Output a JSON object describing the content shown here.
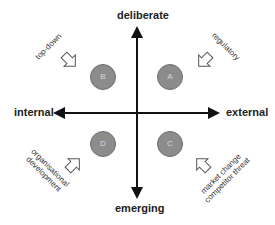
{
  "axes": {
    "top": "deliberate",
    "bottom": "emerging",
    "left": "internal",
    "right": "external"
  },
  "quadrants": [
    {
      "id": "B",
      "position": "top-left",
      "label": "top-down"
    },
    {
      "id": "A",
      "position": "top-right",
      "label": "regulatory"
    },
    {
      "id": "D",
      "position": "bottom-left",
      "label_line1": "organisational",
      "label_line2": "development"
    },
    {
      "id": "C",
      "position": "bottom-right",
      "label_line1": "market change",
      "label_line2": "competitor threat"
    }
  ],
  "colors": {
    "axis": "#111111",
    "circle_fill": "#8c8c8c",
    "circle_text": "#d9d9d9",
    "arrow_outline": "#555555"
  }
}
